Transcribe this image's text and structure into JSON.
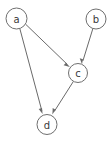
{
  "diagram": {
    "type": "directed-graph",
    "width": 110,
    "height": 142,
    "background_color": "#ffffff",
    "node_stroke_color": "#6f6f6f",
    "node_fill_color": "#ffffff",
    "edge_color": "#6a6a6a",
    "label_color": "#3a3a3a",
    "nodes": [
      {
        "id": "a",
        "label": "a",
        "cx": 16.5,
        "cy": 18.5,
        "r": 10.5
      },
      {
        "id": "b",
        "label": "b",
        "cx": 96.0,
        "cy": 19.0,
        "r": 10.0
      },
      {
        "id": "c",
        "label": "c",
        "cx": 78.0,
        "cy": 73.0,
        "r": 9.5
      },
      {
        "id": "d",
        "label": "d",
        "cx": 47.0,
        "cy": 124.5,
        "r": 10.0
      }
    ],
    "edges": [
      {
        "id": "a-c",
        "from": "a",
        "to": "c",
        "directed": true,
        "x1": 25.6,
        "y1": 24.2,
        "x2": 69.4,
        "y2": 66.4
      },
      {
        "id": "a-d",
        "from": "a",
        "to": "d",
        "directed": true,
        "x1": 19.8,
        "y1": 28.5,
        "x2": 42.6,
        "y2": 113.6
      },
      {
        "id": "b-c",
        "from": "b",
        "to": "c",
        "directed": true,
        "x1": 92.9,
        "y1": 28.5,
        "x2": 82.1,
        "y2": 63.8
      },
      {
        "id": "c-d",
        "from": "c",
        "to": "d",
        "directed": true,
        "x1": 73.4,
        "y1": 81.4,
        "x2": 52.6,
        "y2": 114.1
      }
    ]
  }
}
